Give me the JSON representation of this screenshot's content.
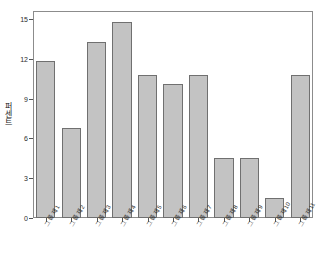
{
  "chart_data": {
    "type": "bar",
    "title": "",
    "xlabel": "",
    "ylabel": "퍼센트",
    "ylim": [
      0,
      15.6
    ],
    "yticks": [
      0,
      3,
      6,
      9,
      12,
      15
    ],
    "ytick_labels": [
      "0",
      "3",
      "6",
      "9",
      "12",
      "15"
    ],
    "grid": false,
    "legend": false,
    "bar_color": "#c3c3c3",
    "bar_edge_color": "#707070",
    "categories": [
      "그룹 제1",
      "그룹 제2",
      "그룹 제3",
      "그룹 제4",
      "그룹 제5",
      "그룹 제6",
      "그룹 제7",
      "그룹 제8",
      "그룹 제9",
      "그룹 제10",
      "그룹 제11"
    ],
    "values": [
      11.8,
      6.8,
      13.3,
      14.8,
      10.8,
      10.1,
      10.8,
      4.5,
      4.5,
      1.5,
      10.8
    ]
  },
  "axes": {
    "y_axis_title": "퍼센트",
    "y_axis_name": "percent-axis",
    "x_axis_name": "group-axis"
  }
}
